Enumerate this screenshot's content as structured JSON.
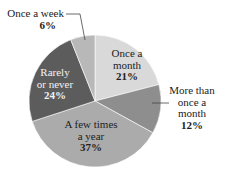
{
  "chart_data": {
    "type": "pie",
    "title": "",
    "start_angle": "top (12 o'clock), clockwise",
    "categories": [
      "Once a month",
      "More than once a month",
      "A few times a year",
      "Rarely or never",
      "Once a week"
    ],
    "values": [
      21,
      12,
      37,
      24,
      6
    ],
    "unit": "%",
    "colors": [
      "#d9d9d9",
      "#8e8e8e",
      "#ababab",
      "#5c5c5c",
      "#b8b8b8"
    ],
    "slices": [
      {
        "label_lines": [
          "Once a",
          "month"
        ],
        "pct_label": "21%",
        "value": 21,
        "color": "#d9d9d9",
        "text_color": "#222222",
        "label_inside": true
      },
      {
        "label_lines": [
          "More than",
          "once a",
          "month"
        ],
        "pct_label": "12%",
        "value": 12,
        "color": "#8e8e8e",
        "text_color": "#222222",
        "label_inside": false
      },
      {
        "label_lines": [
          "A few times",
          "a year"
        ],
        "pct_label": "37%",
        "value": 37,
        "color": "#ababab",
        "text_color": "#222222",
        "label_inside": true
      },
      {
        "label_lines": [
          "Rarely",
          "or never"
        ],
        "pct_label": "24%",
        "value": 24,
        "color": "#5c5c5c",
        "text_color": "#f2f2f2",
        "label_inside": true
      },
      {
        "label_lines": [
          "Once a week"
        ],
        "pct_label": "6%",
        "value": 6,
        "color": "#b8b8b8",
        "text_color": "#222222",
        "label_inside": false
      }
    ],
    "legend": "none (direct labels)"
  }
}
